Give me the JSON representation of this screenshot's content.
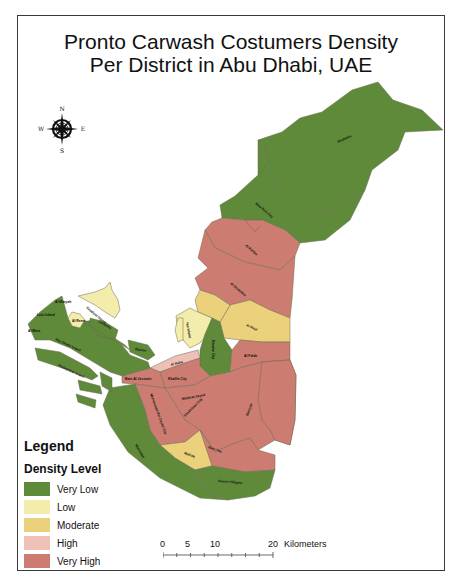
{
  "title": {
    "line1": "Pronto Carwash Costumers Density",
    "line2": "Per District in Abu Dhabi, UAE"
  },
  "compass": {
    "n": "N",
    "s": "S",
    "e": "E",
    "w": "W"
  },
  "legend": {
    "title": "Legend",
    "subtitle": "Density Level",
    "items": [
      {
        "label": "Very Low",
        "color": "#5f8a3a"
      },
      {
        "label": "Low",
        "color": "#f4ecaa"
      },
      {
        "label": "Moderate",
        "color": "#ecd17c"
      },
      {
        "label": "High",
        "color": "#efc1b6"
      },
      {
        "label": "Very High",
        "color": "#cc7c70"
      }
    ]
  },
  "scalebar": {
    "ticks": [
      "0",
      "5",
      "10",
      "20"
    ],
    "unit": "Kilometers"
  },
  "districts": [
    {
      "name": "Shahama",
      "level": "Very Low"
    },
    {
      "name": "New Port City",
      "level": "Very Low"
    },
    {
      "name": "Al Rahba",
      "level": "Very High"
    },
    {
      "name": "Al Shamkha",
      "level": "Very High"
    },
    {
      "name": "Al Reef",
      "level": "Moderate"
    },
    {
      "name": "Yas Island",
      "level": "Low"
    },
    {
      "name": "Saadiyat Island",
      "level": "Low"
    },
    {
      "name": "Al Raha",
      "level": "High"
    },
    {
      "name": "Masdar City",
      "level": "Very Low"
    },
    {
      "name": "Al Falah",
      "level": "Very High"
    },
    {
      "name": "Khalifa City",
      "level": "Very High"
    },
    {
      "name": "Bain Al Jessrain",
      "level": "Very High"
    },
    {
      "name": "Madinat Zayed",
      "level": "Very High"
    },
    {
      "name": "Shakhbout City",
      "level": "Very High"
    },
    {
      "name": "Mohammed Bin Zayed City",
      "level": "Very High"
    },
    {
      "name": "Mafraq",
      "level": "Very High"
    },
    {
      "name": "Baniyas",
      "level": "Very High"
    },
    {
      "name": "Mafraq Industrial",
      "level": "Moderate"
    },
    {
      "name": "Desert Villages",
      "level": "Very Low"
    },
    {
      "name": "Mussafah",
      "level": "Very Low"
    },
    {
      "name": "Abu Dhabi Island",
      "level": "Very Low"
    },
    {
      "name": "Al Maryah",
      "level": "Very Low"
    },
    {
      "name": "Al Reem",
      "level": "Low"
    },
    {
      "name": "Lulu Island",
      "level": "Very Low"
    },
    {
      "name": "Al Mina",
      "level": "Very Low"
    },
    {
      "name": "Corniche",
      "level": "Very Low"
    },
    {
      "name": "Al Bateen",
      "level": "Very Low"
    },
    {
      "name": "Umm Al Nar",
      "level": "Very Low"
    },
    {
      "name": "Hudayriyat Island",
      "level": "Very Low"
    },
    {
      "name": "Mussafah Channel",
      "level": "Very Low"
    },
    {
      "name": "Al Dhafra",
      "level": "Very Low"
    }
  ]
}
